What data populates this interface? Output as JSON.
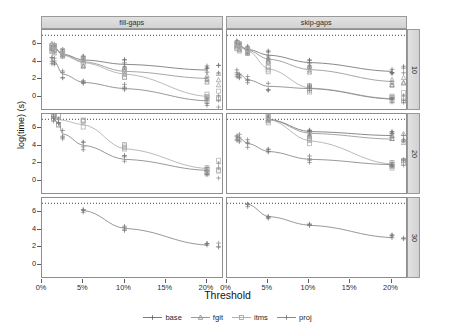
{
  "chart_data": {
    "type": "line",
    "title": "",
    "xlabel": "Threshold",
    "ylabel": "log(time) (s)",
    "xlim": [
      0,
      22
    ],
    "ylim": [
      -1.6,
      7.6
    ],
    "grid": false,
    "legend_position": "bottom",
    "x_ticks": [
      {
        "value": 0,
        "label": "0%"
      },
      {
        "value": 5,
        "label": "5%"
      },
      {
        "value": 10,
        "label": "10%"
      },
      {
        "value": 15,
        "label": "15%"
      },
      {
        "value": 20,
        "label": "20%"
      }
    ],
    "y_ticks": [
      {
        "value": 0,
        "label": "0"
      },
      {
        "value": 2,
        "label": "2"
      },
      {
        "value": 4,
        "label": "4"
      },
      {
        "value": 6,
        "label": "6"
      }
    ],
    "column_facets": [
      "fill-gaps",
      "skip-gaps"
    ],
    "row_facets": [
      "10",
      "20",
      "30"
    ],
    "reference_line": {
      "y": 7.0,
      "style": "dotted"
    },
    "series_names": [
      "base",
      "fgit",
      "itms",
      "proj"
    ],
    "series_colors": {
      "base": "#6b6b6b",
      "fgit": "#8e8e8e",
      "itms": "#a8a8a8",
      "proj": "#7d7d7d"
    },
    "series_symbols": {
      "base": "plus",
      "fgit": "triangle",
      "itms": "square",
      "proj": "plus"
    },
    "panels": [
      {
        "col": "fill-gaps",
        "row": "10",
        "series": [
          {
            "name": "base",
            "x": [
              1.2,
              1.5,
              2.5,
              5,
              10,
              20
            ],
            "y": [
              5.8,
              5.6,
              4.85,
              4.2,
              3.7,
              3.05
            ]
          },
          {
            "name": "fgit",
            "x": [
              1.2,
              1.5,
              2.5,
              5,
              10,
              20
            ],
            "y": [
              5.7,
              5.5,
              4.8,
              4.0,
              2.9,
              2.1
            ]
          },
          {
            "name": "itms",
            "x": [
              1.2,
              1.5,
              2.5,
              5,
              10,
              20
            ],
            "y": [
              5.6,
              5.45,
              4.75,
              3.9,
              2.6,
              0.05
            ]
          },
          {
            "name": "proj",
            "x": [
              1.2,
              1.5,
              2.5,
              5,
              10,
              20
            ],
            "y": [
              4.1,
              4.0,
              2.6,
              1.65,
              0.95,
              -0.45
            ]
          }
        ],
        "scatter_jitter": 0.55
      },
      {
        "col": "fill-gaps",
        "row": "20",
        "series": [
          {
            "name": "itms",
            "x": [
              1.4,
              2.0,
              5,
              10,
              20
            ],
            "y": [
              7.0,
              6.95,
              6.4,
              3.65,
              1.4
            ]
          },
          {
            "name": "proj",
            "x": [
              1.4,
              2.0,
              2.5,
              5,
              10,
              20
            ],
            "y": [
              7.0,
              6.6,
              5.35,
              4.05,
              2.45,
              1.2
            ]
          }
        ],
        "scatter_jitter": 0.6
      },
      {
        "col": "fill-gaps",
        "row": "30",
        "series": [
          {
            "name": "proj",
            "x": [
              5,
              10,
              20
            ],
            "y": [
              6.2,
              4.15,
              2.25
            ]
          }
        ],
        "scatter_jitter": 0.25
      },
      {
        "col": "skip-gaps",
        "row": "10",
        "series": [
          {
            "name": "base",
            "x": [
              1.2,
              1.5,
              2.5,
              5,
              10,
              20
            ],
            "y": [
              5.95,
              5.8,
              5.4,
              4.75,
              3.9,
              2.9
            ]
          },
          {
            "name": "fgit",
            "x": [
              1.2,
              1.5,
              2.5,
              5,
              10,
              20
            ],
            "y": [
              5.85,
              5.7,
              5.3,
              4.3,
              3.1,
              1.75
            ]
          },
          {
            "name": "itms",
            "x": [
              1.2,
              1.5,
              2.5,
              5,
              10,
              20
            ],
            "y": [
              5.8,
              5.65,
              5.25,
              3.2,
              1.0,
              -0.2
            ]
          },
          {
            "name": "proj",
            "x": [
              1.2,
              1.5,
              2.5,
              5,
              10,
              20
            ],
            "y": [
              2.75,
              2.6,
              1.95,
              1.2,
              0.95,
              -0.25
            ]
          }
        ],
        "scatter_jitter": 0.5
      },
      {
        "col": "skip-gaps",
        "row": "20",
        "series": [
          {
            "name": "base",
            "x": [
              5,
              10,
              20
            ],
            "y": [
              7.0,
              5.6,
              5.15
            ]
          },
          {
            "name": "fgit",
            "x": [
              5,
              10,
              20
            ],
            "y": [
              7.0,
              5.4,
              4.75
            ]
          },
          {
            "name": "itms",
            "x": [
              5,
              10,
              20
            ],
            "y": [
              7.0,
              4.55,
              1.9
            ]
          },
          {
            "name": "proj",
            "x": [
              1.2,
              1.5,
              2.5,
              5,
              10,
              20
            ],
            "y": [
              5.0,
              4.85,
              4.25,
              3.35,
              2.45,
              1.85
            ]
          }
        ],
        "scatter_jitter": 0.45
      },
      {
        "col": "skip-gaps",
        "row": "30",
        "series": [
          {
            "name": "proj",
            "x": [
              2.5,
              5,
              10,
              20
            ],
            "y": [
              6.9,
              5.5,
              4.5,
              3.1
            ]
          }
        ],
        "scatter_jitter": 0.3
      }
    ]
  },
  "axis": {
    "ylabel": "log(time) (s)",
    "xlabel": "Threshold"
  },
  "legend": {
    "items": [
      {
        "label": "base"
      },
      {
        "label": "fgit"
      },
      {
        "label": "itms"
      },
      {
        "label": "proj"
      }
    ]
  }
}
